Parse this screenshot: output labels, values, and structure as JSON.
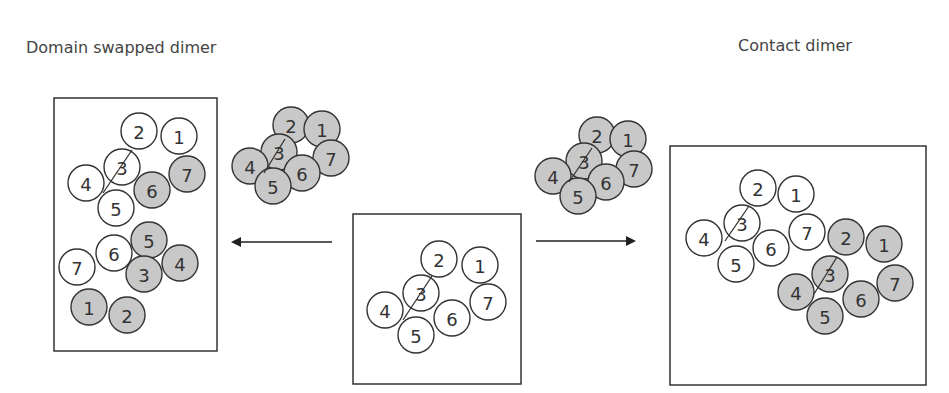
{
  "titles": {
    "left": "Domain swapped dimer",
    "right": "Contact dimer"
  },
  "colors": {
    "shaded": "#c8c8c8",
    "unshaded": "#ffffff",
    "stroke": "#333333",
    "box": "#333333"
  },
  "panels": [
    {
      "id": "domain-swapped-dimer",
      "box": {
        "x": 54,
        "y": 98,
        "w": 163,
        "h": 253
      },
      "circles": [
        {
          "label": "2",
          "x": 139,
          "y": 131,
          "shaded": false
        },
        {
          "label": "1",
          "x": 179,
          "y": 136,
          "shaded": false
        },
        {
          "label": "3",
          "x": 122,
          "y": 167,
          "shaded": false
        },
        {
          "label": "7",
          "x": 187,
          "y": 174,
          "shaded": true
        },
        {
          "label": "4",
          "x": 86,
          "y": 183,
          "shaded": false
        },
        {
          "label": "6",
          "x": 152,
          "y": 190,
          "shaded": true
        },
        {
          "label": "5",
          "x": 116,
          "y": 208,
          "shaded": false
        },
        {
          "label": "5",
          "x": 149,
          "y": 240,
          "shaded": true
        },
        {
          "label": "6",
          "x": 114,
          "y": 253,
          "shaded": false
        },
        {
          "label": "4",
          "x": 180,
          "y": 263,
          "shaded": true
        },
        {
          "label": "7",
          "x": 77,
          "y": 267,
          "shaded": false
        },
        {
          "label": "3",
          "x": 144,
          "y": 274,
          "shaded": true
        },
        {
          "label": "1",
          "x": 89,
          "y": 307,
          "shaded": true
        },
        {
          "label": "2",
          "x": 127,
          "y": 315,
          "shaded": true
        }
      ],
      "hinge_lines": [
        {
          "x1": 132,
          "y1": 150,
          "x2": 103,
          "y2": 193
        }
      ]
    },
    {
      "id": "shaded-monomer-left",
      "circles": [
        {
          "label": "2",
          "x": 291,
          "y": 125,
          "shaded": true
        },
        {
          "label": "1",
          "x": 322,
          "y": 129,
          "shaded": true
        },
        {
          "label": "3",
          "x": 279,
          "y": 152,
          "shaded": true
        },
        {
          "label": "7",
          "x": 331,
          "y": 158,
          "shaded": true
        },
        {
          "label": "4",
          "x": 250,
          "y": 166,
          "shaded": true
        },
        {
          "label": "6",
          "x": 302,
          "y": 173,
          "shaded": true
        },
        {
          "label": "5",
          "x": 273,
          "y": 186,
          "shaded": true
        }
      ],
      "hinge_lines": [
        {
          "x1": 285,
          "y1": 139,
          "x2": 264,
          "y2": 173
        }
      ]
    },
    {
      "id": "monomer-center",
      "box": {
        "x": 353,
        "y": 214,
        "w": 168,
        "h": 170
      },
      "circles": [
        {
          "label": "2",
          "x": 439,
          "y": 259,
          "shaded": false
        },
        {
          "label": "1",
          "x": 480,
          "y": 265,
          "shaded": false
        },
        {
          "label": "3",
          "x": 421,
          "y": 293,
          "shaded": false
        },
        {
          "label": "7",
          "x": 488,
          "y": 302,
          "shaded": false
        },
        {
          "label": "4",
          "x": 385,
          "y": 310,
          "shaded": false
        },
        {
          "label": "6",
          "x": 452,
          "y": 318,
          "shaded": false
        },
        {
          "label": "5",
          "x": 416,
          "y": 335,
          "shaded": false
        }
      ],
      "hinge_lines": [
        {
          "x1": 432,
          "y1": 276,
          "x2": 403,
          "y2": 320
        }
      ]
    },
    {
      "id": "shaded-monomer-right",
      "circles": [
        {
          "label": "2",
          "x": 597,
          "y": 135,
          "shaded": true
        },
        {
          "label": "1",
          "x": 628,
          "y": 139,
          "shaded": true
        },
        {
          "label": "3",
          "x": 584,
          "y": 161,
          "shaded": true
        },
        {
          "label": "7",
          "x": 634,
          "y": 169,
          "shaded": true
        },
        {
          "label": "4",
          "x": 553,
          "y": 176,
          "shaded": true
        },
        {
          "label": "6",
          "x": 606,
          "y": 182,
          "shaded": true
        },
        {
          "label": "5",
          "x": 578,
          "y": 196,
          "shaded": true
        }
      ],
      "hinge_lines": [
        {
          "x1": 592,
          "y1": 148,
          "x2": 569,
          "y2": 182
        }
      ]
    },
    {
      "id": "contact-dimer",
      "box": {
        "x": 670,
        "y": 146,
        "w": 256,
        "h": 239
      },
      "circles": [
        {
          "label": "2",
          "x": 758,
          "y": 188,
          "shaded": false
        },
        {
          "label": "1",
          "x": 796,
          "y": 194,
          "shaded": false
        },
        {
          "label": "3",
          "x": 742,
          "y": 223,
          "shaded": false
        },
        {
          "label": "7",
          "x": 807,
          "y": 232,
          "shaded": false
        },
        {
          "label": "4",
          "x": 704,
          "y": 238,
          "shaded": false
        },
        {
          "label": "6",
          "x": 771,
          "y": 248,
          "shaded": false
        },
        {
          "label": "5",
          "x": 736,
          "y": 264,
          "shaded": false
        },
        {
          "label": "2",
          "x": 846,
          "y": 237,
          "shaded": true
        },
        {
          "label": "1",
          "x": 884,
          "y": 244,
          "shaded": true
        },
        {
          "label": "3",
          "x": 830,
          "y": 274,
          "shaded": true
        },
        {
          "label": "7",
          "x": 895,
          "y": 283,
          "shaded": true
        },
        {
          "label": "4",
          "x": 796,
          "y": 292,
          "shaded": true
        },
        {
          "label": "6",
          "x": 861,
          "y": 299,
          "shaded": true
        },
        {
          "label": "5",
          "x": 825,
          "y": 316,
          "shaded": true
        }
      ],
      "hinge_lines": [
        {
          "x1": 749,
          "y1": 206,
          "x2": 725,
          "y2": 241
        },
        {
          "x1": 837,
          "y1": 257,
          "x2": 814,
          "y2": 294
        }
      ]
    }
  ],
  "arrows": [
    {
      "id": "arrow-left",
      "x1": 332,
      "y1": 242,
      "x2": 233,
      "y2": 242
    },
    {
      "id": "arrow-right",
      "x1": 536,
      "y1": 241,
      "x2": 634,
      "y2": 241
    }
  ],
  "circle_radius": 18
}
